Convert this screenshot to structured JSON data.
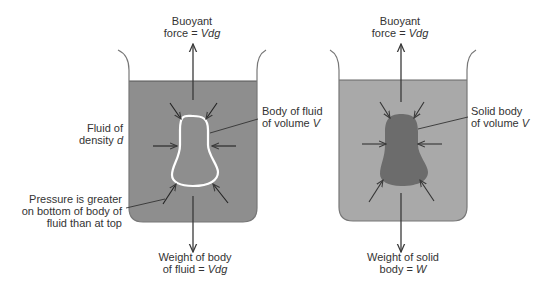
{
  "colors": {
    "left_fluid": "#8e8e8e",
    "right_fluid": "#a9a9a9",
    "solid_body": "#6c6c6c",
    "fluid_body_outline": "#ffffff",
    "beaker_wall": "#777777",
    "arrow": "#3a3a3a",
    "text": "#333333"
  },
  "left_beaker": {
    "buoyant_label": {
      "line1": "Buoyant",
      "line2_prefix": "force = ",
      "line2_var": "Vdg"
    },
    "fluid_label": {
      "line1": "Fluid of",
      "line2_prefix": "density ",
      "line2_var": "d"
    },
    "body_label": {
      "line1": "Body of fluid",
      "line2_prefix": "of volume ",
      "line2_var": "V"
    },
    "pressure_label": {
      "line1": "Pressure is greater",
      "line2": "on bottom of body of",
      "line3": "fluid than at top"
    },
    "weight_label": {
      "line1": "Weight of body",
      "line2_prefix": "of fluid = ",
      "line2_var": "Vdg"
    }
  },
  "right_beaker": {
    "buoyant_label": {
      "line1": "Buoyant",
      "line2_prefix": "force = ",
      "line2_var": "Vdg"
    },
    "body_label": {
      "line1": "Solid body",
      "line2_prefix": "of volume ",
      "line2_var": "V"
    },
    "weight_label": {
      "line1": "Weight of solid",
      "line2_prefix": "body = ",
      "line2_var": "W"
    }
  }
}
